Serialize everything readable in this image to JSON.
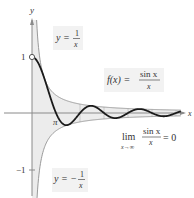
{
  "figure": {
    "axes": {
      "x_label": "x",
      "y_label": "y",
      "y_ticks": [
        {
          "value": 1,
          "label": "1"
        },
        {
          "value": -1,
          "label": "−1"
        }
      ],
      "x_ticks": [
        {
          "value": "pi",
          "label": "π"
        }
      ]
    },
    "labels": {
      "upper_envelope": {
        "lhs": "y =",
        "num": "1",
        "den": "x"
      },
      "lower_envelope": {
        "lhs": "y = −",
        "num": "1",
        "den": "x"
      },
      "function": {
        "lhs": "f(x) =",
        "num": "sin x",
        "den": "x"
      },
      "limit": {
        "lim": "lim",
        "sub": "x→∞",
        "num": "sin x",
        "den": "x",
        "rhs": "= 0"
      }
    },
    "colors": {
      "curve": "#1a1a1a",
      "envelope": "#9a9a9a",
      "shade": "#ececec",
      "axis": "#8a8a8a",
      "label_bg": "#f2f2f2"
    }
  }
}
